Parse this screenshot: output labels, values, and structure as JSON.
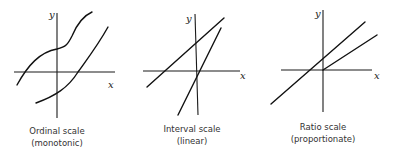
{
  "panels": [
    {
      "caption_line1": "Ordinal scale",
      "caption_line2": "(monotonic)",
      "x_label": "x",
      "y_label": "y"
    },
    {
      "caption_line1": "Interval scale",
      "caption_line2": "(linear)",
      "x_label": "x",
      "y_label": "y"
    },
    {
      "caption_line1": "Ratio scale",
      "caption_line2": "(proportionate)",
      "x_label": "x",
      "y_label": "y"
    }
  ],
  "colors": {
    "line": "#111111",
    "background": "#ffffff"
  }
}
